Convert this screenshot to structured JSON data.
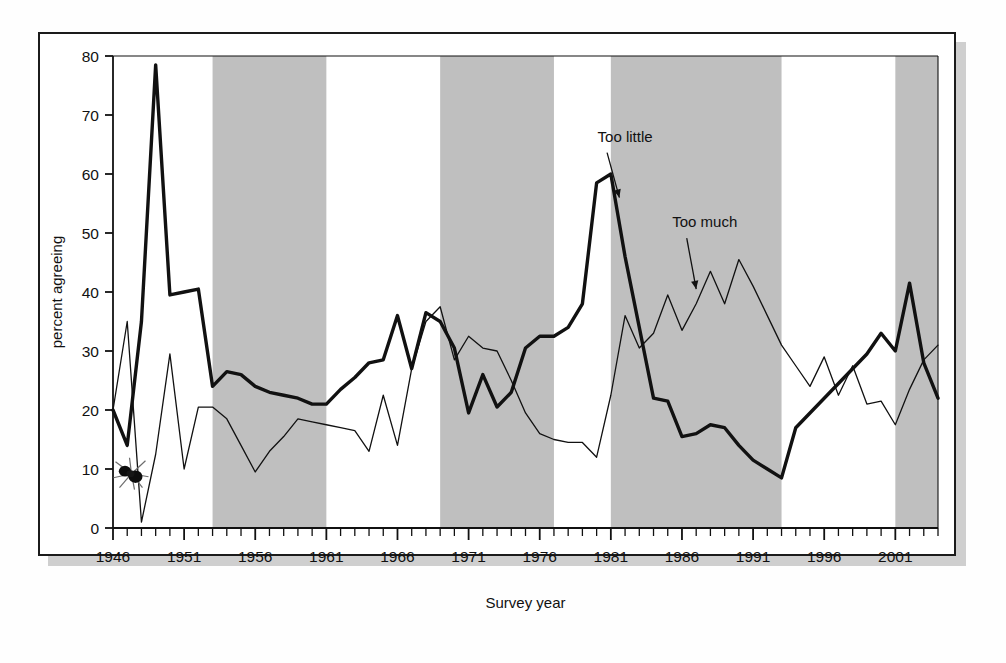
{
  "figure": {
    "background_color": "#ffffff",
    "frame_color": "#1b1b1b",
    "shadow_color": "#cfcfcf",
    "band_color": "#bfbfbf",
    "series_thick_color": "#111111",
    "series_thin_color": "#111111"
  },
  "chart_data": {
    "type": "line",
    "title": "",
    "xlabel": "Survey year",
    "ylabel": "percent agreeing",
    "xlim": [
      1946,
      2004
    ],
    "ylim": [
      0,
      80
    ],
    "yticks": [
      0,
      10,
      20,
      30,
      40,
      50,
      60,
      70,
      80
    ],
    "xticks_major": [
      1946,
      1951,
      1956,
      1961,
      1966,
      1971,
      1976,
      1981,
      1986,
      1991,
      1996,
      2001
    ],
    "xtick_interval_minor": 1,
    "grid": false,
    "legend_position": "inline-annotations",
    "annotations": [
      {
        "text": "Too little",
        "target_series": "Too little",
        "x": 1982.0,
        "y": 65.5,
        "arrow_to_x": 1981.6,
        "arrow_to_y": 56.0
      },
      {
        "text": "Too much",
        "target_series": "Too much",
        "x": 1987.6,
        "y": 51.0,
        "arrow_to_x": 1987.0,
        "arrow_to_y": 40.5
      }
    ],
    "shaded_bands": {
      "label": "Republican presidential administrations",
      "color": "#bfbfbf",
      "ranges": [
        [
          1953,
          1961
        ],
        [
          1969,
          1977
        ],
        [
          1981,
          1993
        ],
        [
          2001,
          2004
        ]
      ]
    },
    "artifact": {
      "name": "fly-speck",
      "description": "dark insect smudge on scan",
      "x": 1947.3,
      "y": 9.2
    },
    "series": [
      {
        "name": "Too little",
        "style": "thick",
        "x": [
          1946,
          1947,
          1948,
          1949,
          1950,
          1951,
          1952,
          1953,
          1954,
          1955,
          1956,
          1957,
          1958,
          1959,
          1960,
          1961,
          1962,
          1963,
          1964,
          1965,
          1966,
          1967,
          1968,
          1969,
          1970,
          1971,
          1972,
          1973,
          1974,
          1975,
          1976,
          1977,
          1978,
          1979,
          1980,
          1981,
          1982,
          1983,
          1984,
          1985,
          1986,
          1987,
          1988,
          1989,
          1990,
          1991,
          1992,
          1993,
          1994,
          1995,
          1996,
          1997,
          1998,
          1999,
          2000,
          2001,
          2002,
          2003,
          2004
        ],
        "y": [
          20.0,
          14.0,
          35.0,
          78.5,
          39.5,
          40.0,
          40.5,
          24.0,
          26.5,
          26.0,
          24.0,
          23.0,
          22.5,
          22.0,
          21.0,
          21.0,
          23.5,
          25.5,
          28.0,
          28.5,
          36.0,
          27.0,
          36.5,
          35.0,
          30.5,
          19.5,
          26.0,
          20.5,
          23.0,
          30.5,
          32.5,
          32.5,
          34.0,
          38.0,
          58.5,
          60.0,
          46.0,
          34.0,
          22.0,
          21.5,
          15.5,
          16.0,
          17.5,
          17.0,
          14.0,
          11.5,
          10.0,
          8.5,
          17.0,
          19.5,
          22.0,
          24.5,
          27.0,
          29.5,
          33.0,
          30.0,
          41.5,
          28.0,
          22.0
        ]
      },
      {
        "name": "Too much",
        "style": "thin",
        "x": [
          1946,
          1947,
          1948,
          1949,
          1950,
          1951,
          1952,
          1953,
          1954,
          1955,
          1956,
          1957,
          1958,
          1959,
          1960,
          1961,
          1962,
          1963,
          1964,
          1965,
          1966,
          1967,
          1968,
          1969,
          1970,
          1971,
          1972,
          1973,
          1974,
          1975,
          1976,
          1977,
          1978,
          1979,
          1980,
          1981,
          1982,
          1983,
          1984,
          1985,
          1986,
          1987,
          1988,
          1989,
          1990,
          1991,
          1992,
          1993,
          1994,
          1995,
          1996,
          1997,
          1998,
          1999,
          2000,
          2001,
          2002,
          2003,
          2004
        ],
        "y": [
          20.0,
          35.0,
          1.0,
          12.5,
          29.5,
          10.0,
          20.5,
          20.5,
          18.5,
          14.0,
          9.5,
          13.0,
          15.5,
          18.5,
          18.0,
          17.5,
          17.0,
          16.5,
          13.0,
          22.5,
          14.0,
          27.0,
          35.0,
          37.5,
          28.5,
          32.5,
          30.5,
          30.0,
          25.0,
          19.5,
          16.0,
          15.0,
          14.5,
          14.5,
          12.0,
          22.5,
          36.0,
          30.5,
          33.0,
          39.5,
          33.5,
          38.0,
          43.5,
          38.0,
          45.5,
          41.0,
          36.0,
          31.0,
          27.5,
          24.0,
          29.0,
          22.5,
          27.5,
          21.0,
          21.5,
          17.5,
          23.5,
          28.5,
          31.0
        ]
      }
    ]
  }
}
